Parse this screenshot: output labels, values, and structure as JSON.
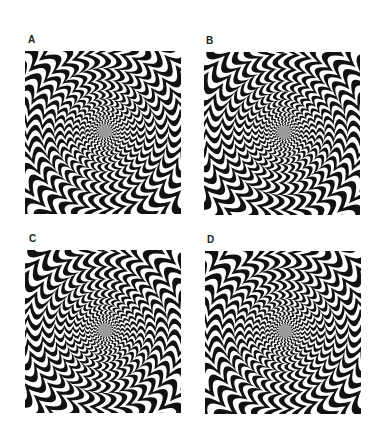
{
  "figure": {
    "panels": [
      {
        "label": "A",
        "twist": 1,
        "x": 25,
        "y": 51,
        "label_x": 28,
        "label_y": 34
      },
      {
        "label": "B",
        "twist": -1,
        "x": 204,
        "y": 52,
        "label_x": 206,
        "label_y": 35
      },
      {
        "label": "C",
        "twist": -1,
        "x": 25,
        "y": 250,
        "label_x": 29,
        "label_y": 233
      },
      {
        "label": "D",
        "twist": 1,
        "x": 205,
        "y": 251,
        "label_x": 207,
        "label_y": 234
      }
    ],
    "colors": {
      "stripe": "#111111",
      "background": "#ffffff",
      "center": "#9a9a9a"
    }
  }
}
